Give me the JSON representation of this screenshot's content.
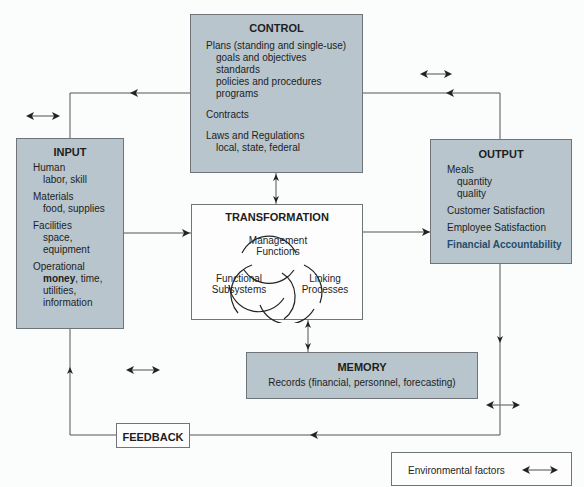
{
  "control": {
    "title": "CONTROL",
    "plans": "Plans (standing and single-use)",
    "plan_items": [
      "goals and objectives",
      "standards",
      "policies and procedures",
      "programs"
    ],
    "contracts": "Contracts",
    "laws": "Laws and Regulations",
    "laws_detail": "local, state, federal"
  },
  "input": {
    "title": "INPUT",
    "groups": [
      {
        "head": "Human",
        "items": [
          "labor, skill"
        ]
      },
      {
        "head": "Materials",
        "items": [
          "food, supplies"
        ]
      },
      {
        "head": "Facilities",
        "items": [
          "space,",
          "equipment"
        ]
      }
    ],
    "operational": "Operational",
    "money": "money",
    "money_rest": ", time,",
    "op_items": [
      "utilities,",
      "information"
    ]
  },
  "transformation": {
    "title": "TRANSFORMATION",
    "management": [
      "Management",
      "Functions"
    ],
    "functional": [
      "Functional",
      "Subsystems"
    ],
    "linking": [
      "Linking",
      "Processes"
    ]
  },
  "output": {
    "title": "OUTPUT",
    "meals": "Meals",
    "meal_items": [
      "quantity",
      "quality"
    ],
    "customer": "Customer Satisfaction",
    "employee": "Employee Satisfaction",
    "financial": "Financial Accountability"
  },
  "memory": {
    "title": "MEMORY",
    "records": "Records (financial, personnel, forecasting)"
  },
  "feedback": {
    "title": "FEEDBACK"
  },
  "legend": {
    "label": "Environmental factors",
    "icon": "double-arrow-icon"
  },
  "colors": {
    "box_fill": "#b8c5cd",
    "accent_text": "#1f4d6c",
    "line": "#4a4a4a"
  }
}
